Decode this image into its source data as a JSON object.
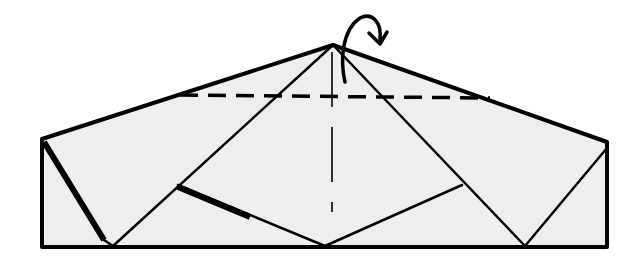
{
  "diagram": {
    "type": "origami-fold-step",
    "colors": {
      "paper": "#eeeeee",
      "line": "#000000",
      "background": "#ffffff"
    },
    "symbols": [
      {
        "name": "valley-fold-line",
        "style": "dashed horizontal"
      },
      {
        "name": "center-crease",
        "style": "dashed vertical"
      },
      {
        "name": "fold-behind-arrow",
        "style": "curved arrow over apex"
      }
    ]
  }
}
